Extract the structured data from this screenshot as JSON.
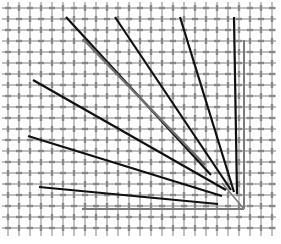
{
  "diagram": {
    "width": 281,
    "height": 244,
    "background": "#ffffff",
    "grid": {
      "spacing": 11,
      "origin_x": 8,
      "origin_y": 8,
      "x_end": 276,
      "y_end": 236,
      "color": "#a8a8a8",
      "knot_color": "#888888",
      "style": "woven"
    },
    "axes": [
      {
        "name": "vertical-reference-line",
        "x1": 244,
        "y1": 40,
        "x2": 244,
        "y2": 209,
        "color": "#7a7a7a",
        "width": 2
      },
      {
        "name": "horizontal-reference-line",
        "x1": 82,
        "y1": 209,
        "x2": 244,
        "y2": 209,
        "color": "#7a7a7a",
        "width": 2
      },
      {
        "name": "vertex-connector",
        "x1": 222,
        "y1": 183,
        "x2": 244,
        "y2": 209,
        "color": "#7a7a7a",
        "width": 1.5
      }
    ],
    "rays": [
      {
        "name": "ray-1",
        "x1": 39,
        "y1": 187,
        "x2": 218,
        "y2": 204,
        "color": "#111111",
        "width": 2.2
      },
      {
        "name": "ray-2",
        "x1": 28,
        "y1": 136,
        "x2": 222,
        "y2": 196,
        "color": "#111111",
        "width": 2.2
      },
      {
        "name": "ray-3",
        "x1": 33,
        "y1": 80,
        "x2": 226,
        "y2": 190,
        "color": "#111111",
        "width": 2.2
      },
      {
        "name": "ray-4",
        "x1": 66,
        "y1": 17,
        "x2": 211,
        "y2": 175,
        "color": "#111111",
        "width": 2.2
      },
      {
        "name": "ray-5",
        "x1": 115,
        "y1": 17,
        "x2": 231,
        "y2": 190,
        "color": "#111111",
        "width": 2.2
      },
      {
        "name": "ray-6",
        "x1": 180,
        "y1": 17,
        "x2": 234,
        "y2": 192,
        "color": "#111111",
        "width": 2.2
      },
      {
        "name": "ray-7",
        "x1": 234,
        "y1": 17,
        "x2": 237,
        "y2": 194,
        "color": "#111111",
        "width": 2.2
      }
    ],
    "overlays": [
      {
        "name": "gray-ray-segment",
        "x1": 83,
        "y1": 39,
        "x2": 205,
        "y2": 165,
        "color": "#6e6e6e",
        "width": 2.4
      }
    ]
  }
}
